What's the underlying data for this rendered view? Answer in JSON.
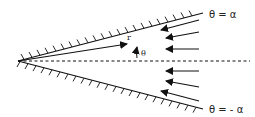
{
  "diagram": {
    "labels": {
      "upper_wall": "θ = α",
      "lower_wall": "θ = - α",
      "radial": "r",
      "angle": "θ"
    },
    "geometry": {
      "apex": [
        18,
        61
      ],
      "upper_wall_end": [
        203,
        13
      ],
      "lower_wall_end": [
        203,
        109
      ],
      "centerline_y": 61,
      "inflow_arrow_count": 6
    },
    "colors": {
      "stroke": "#111111",
      "background": "#ffffff"
    }
  }
}
